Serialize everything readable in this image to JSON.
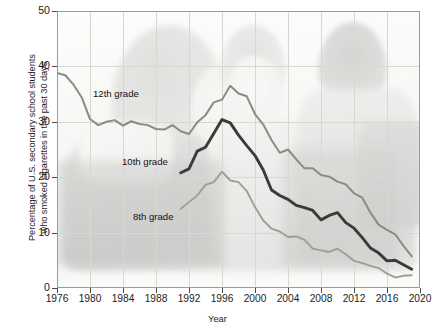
{
  "axes": {
    "ylabel": "Percentage of U.S. secondary school students\nwho smoked cigarettes in the past 30 days",
    "xlabel": "Year",
    "yticks": [
      "0",
      "10",
      "20",
      "30",
      "40",
      "50"
    ],
    "xticks": [
      "1976",
      "1980",
      "1984",
      "1988",
      "1992",
      "1996",
      "2000",
      "2004",
      "2008",
      "2012",
      "2016",
      "2020"
    ]
  },
  "labels": {
    "grade12": "12th grade",
    "grade10": "10th grade",
    "grade8": "8th grade"
  },
  "colors": {
    "grade12_line": "#8a8a87",
    "grade10_line": "#3a3a38",
    "grade8_line": "#9d9d9a",
    "grid": "#d7d7d4",
    "frame": "#9a9a97",
    "text": "#1c1c1c",
    "plot_bg": "#f2f2f0"
  },
  "chart_data": {
    "type": "line",
    "title": "",
    "xlabel": "Year",
    "ylabel": "Percentage of U.S. secondary school students who smoked cigarettes in the past 30 days",
    "xlim": [
      1976,
      2020
    ],
    "ylim": [
      0,
      50
    ],
    "xticks": [
      1976,
      1980,
      1984,
      1988,
      1992,
      1996,
      2000,
      2004,
      2008,
      2012,
      2016,
      2020
    ],
    "yticks": [
      0,
      10,
      20,
      30,
      40,
      50
    ],
    "grid": true,
    "legend": "inline-labels",
    "series": [
      {
        "name": "12th grade",
        "color": "#8a8a87",
        "x": [
          1976,
          1977,
          1978,
          1979,
          1980,
          1981,
          1982,
          1983,
          1984,
          1985,
          1986,
          1987,
          1988,
          1989,
          1990,
          1991,
          1992,
          1993,
          1994,
          1995,
          1996,
          1997,
          1998,
          1999,
          2000,
          2001,
          2002,
          2003,
          2004,
          2005,
          2006,
          2007,
          2008,
          2009,
          2010,
          2011,
          2012,
          2013,
          2014,
          2015,
          2016,
          2017,
          2018,
          2019
        ],
        "y": [
          38.8,
          38.4,
          36.7,
          34.4,
          30.5,
          29.4,
          30.0,
          30.3,
          29.3,
          30.1,
          29.6,
          29.4,
          28.7,
          28.6,
          29.4,
          28.3,
          27.8,
          29.9,
          31.2,
          33.5,
          34.0,
          36.5,
          35.1,
          34.6,
          31.4,
          29.5,
          26.7,
          24.4,
          25.0,
          23.2,
          21.6,
          21.6,
          20.4,
          20.1,
          19.2,
          18.7,
          17.1,
          16.3,
          13.6,
          11.4,
          10.5,
          9.7,
          7.6,
          5.7
        ]
      },
      {
        "name": "10th grade",
        "color": "#3a3a38",
        "x": [
          1991,
          1992,
          1993,
          1994,
          1995,
          1996,
          1997,
          1998,
          1999,
          2000,
          2001,
          2002,
          2003,
          2004,
          2005,
          2006,
          2007,
          2008,
          2009,
          2010,
          2011,
          2012,
          2013,
          2014,
          2015,
          2016,
          2017,
          2018,
          2019
        ],
        "y": [
          20.8,
          21.5,
          24.7,
          25.4,
          27.9,
          30.4,
          29.8,
          27.6,
          25.7,
          23.9,
          21.3,
          17.7,
          16.7,
          16.0,
          14.9,
          14.5,
          14.0,
          12.3,
          13.1,
          13.6,
          11.8,
          10.8,
          9.1,
          7.2,
          6.3,
          4.9,
          5.0,
          4.2,
          3.4
        ]
      },
      {
        "name": "8th grade",
        "color": "#9d9d9a",
        "x": [
          1991,
          1992,
          1993,
          1994,
          1995,
          1996,
          1997,
          1998,
          1999,
          2000,
          2001,
          2002,
          2003,
          2004,
          2005,
          2006,
          2007,
          2008,
          2009,
          2010,
          2011,
          2012,
          2013,
          2014,
          2015,
          2016,
          2017,
          2018,
          2019
        ],
        "y": [
          14.3,
          15.5,
          16.7,
          18.6,
          19.1,
          21.0,
          19.4,
          19.1,
          17.5,
          14.6,
          12.2,
          10.7,
          10.2,
          9.2,
          9.3,
          8.7,
          7.1,
          6.8,
          6.5,
          7.1,
          6.1,
          4.9,
          4.5,
          4.0,
          3.6,
          2.6,
          1.9,
          2.2,
          2.3
        ]
      }
    ]
  }
}
